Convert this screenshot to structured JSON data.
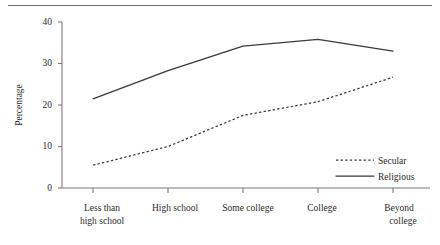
{
  "chart_data": {
    "type": "line",
    "title": "",
    "xlabel": "",
    "ylabel": "Percentage",
    "categories": [
      "Less than high school",
      "High school",
      "Some college",
      "College",
      "Beyond college"
    ],
    "category_lines": [
      [
        "Less than",
        "high school"
      ],
      [
        "High school"
      ],
      [
        "Some college"
      ],
      [
        "College"
      ],
      [
        "Beyond",
        "college"
      ]
    ],
    "series": [
      {
        "name": "Secular",
        "style": "dotted",
        "values": [
          5.5,
          10.0,
          17.5,
          20.8,
          26.7
        ]
      },
      {
        "name": "Religious",
        "style": "solid",
        "values": [
          21.5,
          28.3,
          34.2,
          35.8,
          33.0
        ]
      }
    ],
    "ylim": [
      0,
      40
    ],
    "yticks": [
      0,
      10,
      20,
      30,
      40
    ],
    "ytick_labels": [
      "0",
      "10",
      "20",
      "30",
      "40"
    ],
    "grid": false,
    "legend_position": "lower-right",
    "legend": [
      "Secular",
      "Religious"
    ]
  },
  "axis": {
    "y_title": "Percentage",
    "y_tick_0": "0",
    "y_tick_1": "10",
    "y_tick_2": "20",
    "y_tick_3": "30",
    "y_tick_4": "40"
  },
  "categories": {
    "c0_line0": "Less than",
    "c0_line1": "high school",
    "c1_line0": "High school",
    "c2_line0": "Some college",
    "c3_line0": "College",
    "c4_line0": "Beyond",
    "c4_line1": "college"
  },
  "legend": {
    "secular": "Secular",
    "religious": "Religious"
  },
  "colors": {
    "line": "#3a3a3a",
    "axis": "#7a7a7a",
    "text": "#2b2b2b",
    "background": "#ffffff"
  }
}
